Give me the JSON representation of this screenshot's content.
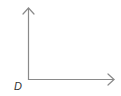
{
  "diagram": {
    "type": "right-angle-rays",
    "vertex_label": "D",
    "line_color": "#8a8a8a",
    "label_color": "#333333"
  }
}
